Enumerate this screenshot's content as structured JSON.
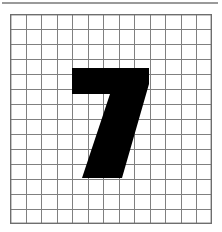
{
  "figure": {
    "background_color": "#ffffff",
    "width": 222,
    "height": 232
  },
  "top_rule": {
    "name": "top-horizontal-rule",
    "color": "#9a9a9a",
    "x": 2,
    "y": 2,
    "width": 216,
    "height": 2
  },
  "grid": {
    "name": "graph-paper-grid",
    "columns": 13,
    "rows": 14,
    "x": 10,
    "y": 14,
    "width": 202,
    "height": 210,
    "cell_width": 15.54,
    "cell_height": 15.0,
    "line_color": "#808080",
    "border_color": "#6e6e6e",
    "line_width": 1,
    "border_width": 1.4,
    "fill_color": "#ffffff"
  },
  "glyph": {
    "name": "digit-seven",
    "character": "7",
    "color": "#000000",
    "bounding_box": {
      "x": 72,
      "y": 68,
      "width": 77,
      "height": 110
    },
    "outline_points": "62,54 139,54 139,70 112,164 72,164 100,80 62,80",
    "description": "Bold sans-serif numeral seven with a flat horizontal top bar and a thick diagonal descending stroke ending in a flat foot"
  },
  "chart_data": {
    "type": "heatmap",
    "subtitle": "",
    "xlabel": "",
    "ylabel": "",
    "grid": true,
    "legend": "none",
    "columns": 13,
    "rows": 14,
    "xlim": [
      0,
      13
    ],
    "ylim": [
      0,
      14
    ],
    "xtick_labels": [],
    "ytick_labels": [],
    "annotations": [
      "7"
    ],
    "colors": {
      "ink": "#000000",
      "paper": "#ffffff",
      "gridline": "#808080"
    },
    "cells": [
      [
        0,
        0,
        0,
        0,
        0,
        0,
        0,
        0,
        0,
        0,
        0,
        0,
        0
      ],
      [
        0,
        0,
        0,
        0,
        0,
        0,
        0,
        0,
        0,
        0,
        0,
        0,
        0
      ],
      [
        0,
        0,
        0,
        0,
        0,
        0,
        0,
        0,
        0,
        0,
        0,
        0,
        0
      ],
      [
        0,
        0,
        0,
        0,
        1,
        1,
        1,
        1,
        1,
        1,
        0,
        0,
        0
      ],
      [
        0,
        0,
        0,
        0,
        1,
        1,
        1,
        1,
        1,
        1,
        0,
        0,
        0
      ],
      [
        0,
        0,
        0,
        0,
        0,
        0,
        0,
        1,
        1,
        1,
        0,
        0,
        0
      ],
      [
        0,
        0,
        0,
        0,
        0,
        0,
        1,
        1,
        1,
        0,
        0,
        0,
        0
      ],
      [
        0,
        0,
        0,
        0,
        0,
        1,
        1,
        1,
        1,
        0,
        0,
        0,
        0
      ],
      [
        0,
        0,
        0,
        0,
        1,
        1,
        1,
        1,
        0,
        0,
        0,
        0,
        0
      ],
      [
        0,
        0,
        0,
        1,
        1,
        1,
        1,
        1,
        0,
        0,
        0,
        0,
        0
      ],
      [
        0,
        0,
        0,
        1,
        1,
        1,
        1,
        0,
        0,
        0,
        0,
        0,
        0
      ],
      [
        0,
        0,
        0,
        0,
        0,
        0,
        0,
        0,
        0,
        0,
        0,
        0,
        0
      ],
      [
        0,
        0,
        0,
        0,
        0,
        0,
        0,
        0,
        0,
        0,
        0,
        0,
        0
      ],
      [
        0,
        0,
        0,
        0,
        0,
        0,
        0,
        0,
        0,
        0,
        0,
        0,
        0
      ]
    ]
  }
}
